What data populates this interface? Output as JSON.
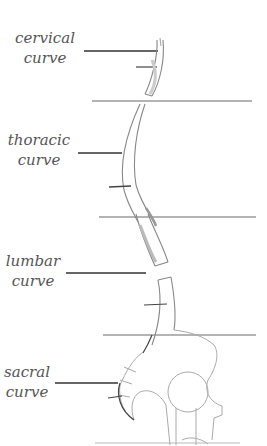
{
  "diagram": {
    "labels": [
      {
        "id": "cervical",
        "line1": "cervical",
        "line2": "curve"
      },
      {
        "id": "thoracic",
        "line1": "thoracic",
        "line2": "curve"
      },
      {
        "id": "lumbar",
        "line1": "lumbar",
        "line2": "curve"
      },
      {
        "id": "sacral",
        "line1": "sacral",
        "line2": "curve"
      }
    ],
    "colors": {
      "text": "#555555",
      "leader_line": "#333333",
      "pencil": "#888888",
      "pencil_light": "#b0b0b0",
      "guide_line": "#8a8a8a"
    }
  }
}
